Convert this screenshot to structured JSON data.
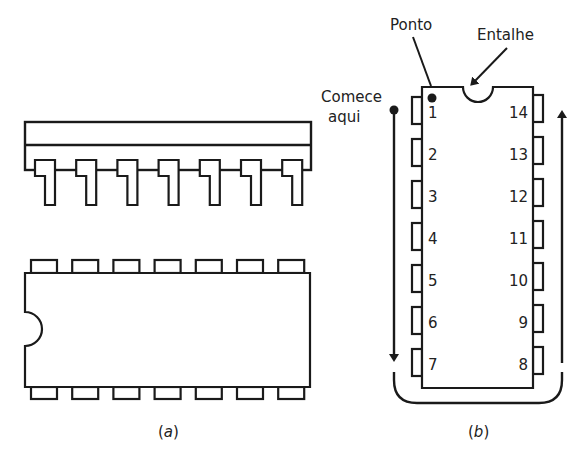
{
  "figure": {
    "panel_a": {
      "caption_open": "(",
      "caption_letter": "a",
      "caption_close": ")",
      "side_view_pin_count": 7,
      "top_view_pins_per_side": 7
    },
    "panel_b": {
      "caption_open": "(",
      "caption_letter": "b",
      "caption_close": ")",
      "labels": {
        "dot": "Ponto",
        "notch": "Entalhe",
        "start_line1": "Comece",
        "start_line2": "aqui"
      },
      "left_pins": [
        "1",
        "2",
        "3",
        "4",
        "5",
        "6",
        "7"
      ],
      "right_pins": [
        "14",
        "13",
        "12",
        "11",
        "10",
        "9",
        "8"
      ]
    }
  }
}
